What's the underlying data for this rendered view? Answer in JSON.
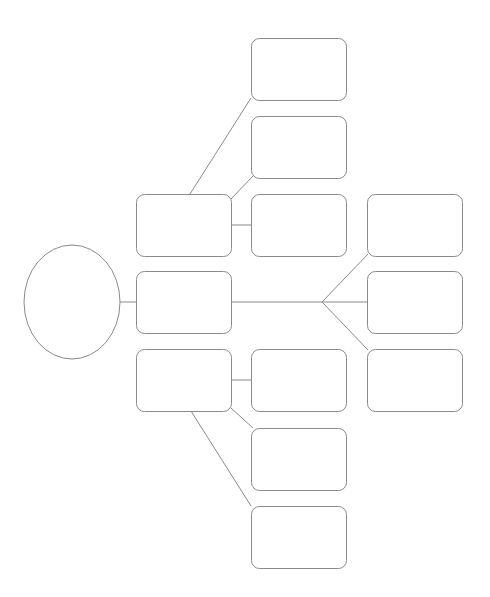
{
  "diagram": {
    "type": "mind-map",
    "colors": {
      "stroke": "#8a8a8a",
      "fill": "#ffffff",
      "background": "#ffffff"
    },
    "nodes": [
      {
        "id": "root",
        "shape": "ellipse",
        "label": ""
      },
      {
        "id": "branch-top",
        "shape": "rounded-rect",
        "label": ""
      },
      {
        "id": "branch-middle",
        "shape": "rounded-rect",
        "label": ""
      },
      {
        "id": "branch-bottom",
        "shape": "rounded-rect",
        "label": ""
      },
      {
        "id": "top-leaf-1",
        "shape": "rounded-rect",
        "label": ""
      },
      {
        "id": "top-leaf-2",
        "shape": "rounded-rect",
        "label": ""
      },
      {
        "id": "top-leaf-3",
        "shape": "rounded-rect",
        "label": ""
      },
      {
        "id": "middle-leaf-1",
        "shape": "rounded-rect",
        "label": ""
      },
      {
        "id": "middle-leaf-2",
        "shape": "rounded-rect",
        "label": ""
      },
      {
        "id": "middle-leaf-3",
        "shape": "rounded-rect",
        "label": ""
      },
      {
        "id": "bottom-leaf-1",
        "shape": "rounded-rect",
        "label": ""
      },
      {
        "id": "bottom-leaf-2",
        "shape": "rounded-rect",
        "label": ""
      },
      {
        "id": "bottom-leaf-3",
        "shape": "rounded-rect",
        "label": ""
      }
    ],
    "edges": [
      {
        "from": "root",
        "to": "branch-middle"
      },
      {
        "from": "branch-top",
        "to": "top-leaf-1"
      },
      {
        "from": "branch-top",
        "to": "top-leaf-2"
      },
      {
        "from": "branch-top",
        "to": "top-leaf-3"
      },
      {
        "from": "branch-middle",
        "to": "middle-leaf-1"
      },
      {
        "from": "branch-middle",
        "to": "middle-leaf-2"
      },
      {
        "from": "branch-middle",
        "to": "middle-leaf-3"
      },
      {
        "from": "branch-bottom",
        "to": "bottom-leaf-1"
      },
      {
        "from": "branch-bottom",
        "to": "bottom-leaf-2"
      },
      {
        "from": "branch-bottom",
        "to": "bottom-leaf-3"
      }
    ]
  }
}
